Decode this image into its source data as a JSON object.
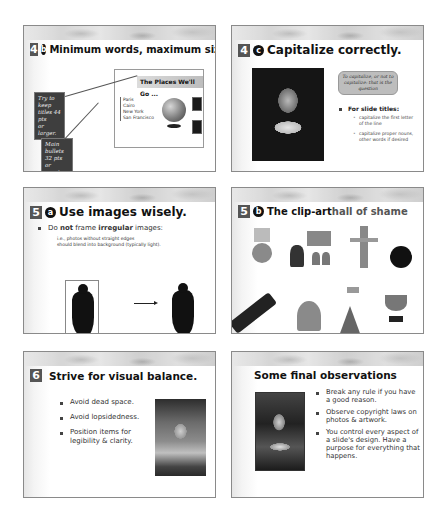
{
  "slides": [
    {
      "number": "4",
      "letter": "b",
      "title": "Minimum words, maximum size",
      "example_slide": {
        "title": "The Places We'll Go ...",
        "items": [
          "Paris",
          "Cairo",
          "New York",
          "San Francisco"
        ]
      },
      "callouts": [
        {
          "text_lines": [
            "Try to keep",
            "titles 44 pts",
            "or larger."
          ]
        },
        {
          "text_lines": [
            "Main bullets",
            "32 pts",
            "or greater."
          ]
        }
      ]
    },
    {
      "number": "4",
      "letter": "c",
      "title": "Capitalize correctly.",
      "speech_bubble": "To capitalize, or not to capitalize: that is the question",
      "bullet_heading": "For slide titles:",
      "sub_bullets": [
        "capitalize the first letter of the line",
        "capitalize proper nouns, other words if desired"
      ]
    },
    {
      "number": "5",
      "letter": "a",
      "title": "Use images wisely.",
      "bullet_parts": [
        "Do ",
        "not",
        " frame ",
        "irregular",
        " images:"
      ],
      "note_lines": [
        "i.e., photos without straight edges",
        "should blend into background (typically light)."
      ]
    },
    {
      "number": "5",
      "letter": "b",
      "title_strong": "The clip-art",
      "title_muted": " hall of shame",
      "clipart": [
        "money-bag",
        "presenter",
        "shrugging-man",
        "bomb",
        "champagne",
        "money-man",
        "climber-flag",
        "trophy"
      ]
    },
    {
      "number": "6",
      "title": "Strive for visual balance.",
      "bullets": [
        "Avoid dead space.",
        "Avoid lopsidedness.",
        "Position items for legibility & clarity."
      ]
    },
    {
      "title": "Some final observations",
      "bullets": [
        "Break any rule if you have a good reason.",
        "Observe copyright laws on photos & artwork.",
        "You control every aspect of a slide's design.  Have a purpose for everything that happens."
      ]
    }
  ],
  "colors": {
    "badge": "#555555",
    "muted_title": "#555555",
    "callout_bg": "#3e3e3e"
  }
}
